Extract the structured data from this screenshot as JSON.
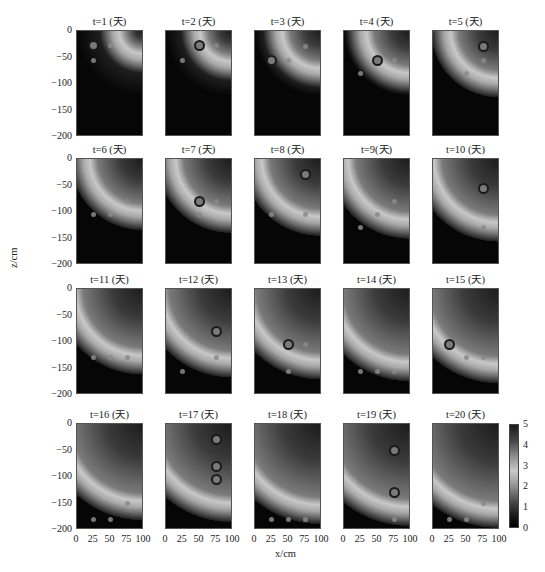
{
  "chart_data": {
    "type": "heatmap",
    "title": "",
    "xlabel": "x/cm",
    "ylabel": "z/cm",
    "xlim": [
      0,
      100
    ],
    "ylim": [
      -200,
      0
    ],
    "x_ticks": [
      "0",
      "25",
      "50",
      "75",
      "100"
    ],
    "y_ticks": [
      "0",
      "-50",
      "-100",
      "-150",
      "-200"
    ],
    "colorbar": {
      "ticks": [
        "5",
        "4",
        "3",
        "2",
        "1",
        "0"
      ],
      "range": [
        0,
        5
      ]
    },
    "grid": false,
    "layout": {
      "rows": 4,
      "cols": 5
    },
    "panels": [
      {
        "title": "t=1 (天)",
        "front_radius": 0.3,
        "dots": [
          [
            25,
            -28
          ],
          [
            50,
            -28
          ],
          [
            25,
            -55
          ]
        ],
        "rings": [
          [
            25,
            -28
          ]
        ]
      },
      {
        "title": "t=2 (天)",
        "front_radius": 0.38,
        "dots": [
          [
            50,
            -28
          ],
          [
            75,
            -28
          ],
          [
            25,
            -55
          ]
        ],
        "rings": [
          [
            50,
            -28
          ]
        ]
      },
      {
        "title": "t=3 (天)",
        "front_radius": 0.45,
        "dots": [
          [
            75,
            -30
          ],
          [
            50,
            -55
          ],
          [
            25,
            -55
          ]
        ],
        "rings": [
          [
            25,
            -55
          ]
        ]
      },
      {
        "title": "t=4 (天)",
        "front_radius": 0.5,
        "dots": [
          [
            50,
            -55
          ],
          [
            75,
            -55
          ],
          [
            25,
            -80
          ]
        ],
        "rings": [
          [
            50,
            -55
          ]
        ]
      },
      {
        "title": "t=5 (天)",
        "front_radius": 0.55,
        "dots": [
          [
            75,
            -30
          ],
          [
            75,
            -55
          ],
          [
            50,
            -80
          ]
        ],
        "rings": [
          [
            75,
            -30
          ]
        ]
      },
      {
        "title": "t=6 (天)",
        "front_radius": 0.6,
        "dots": [
          [
            75,
            -80
          ],
          [
            25,
            -105
          ],
          [
            50,
            -105
          ]
        ],
        "rings": []
      },
      {
        "title": "t=7 (天)",
        "front_radius": 0.63,
        "dots": [
          [
            50,
            -80
          ],
          [
            75,
            -80
          ],
          [
            50,
            -105
          ]
        ],
        "rings": [
          [
            50,
            -80
          ]
        ]
      },
      {
        "title": "t=8 (天)",
        "front_radius": 0.66,
        "dots": [
          [
            75,
            -30
          ],
          [
            25,
            -105
          ],
          [
            75,
            -105
          ]
        ],
        "rings": [
          [
            75,
            -30
          ]
        ]
      },
      {
        "title": "t=9(天)",
        "front_radius": 0.69,
        "dots": [
          [
            75,
            -80
          ],
          [
            50,
            -105
          ],
          [
            25,
            -130
          ]
        ],
        "rings": []
      },
      {
        "title": "t=10 (天)",
        "front_radius": 0.72,
        "dots": [
          [
            75,
            -55
          ],
          [
            75,
            -130
          ]
        ],
        "rings": [
          [
            75,
            -55
          ]
        ]
      },
      {
        "title": "t=11 (天)",
        "front_radius": 0.75,
        "dots": [
          [
            25,
            -130
          ],
          [
            50,
            -130
          ],
          [
            75,
            -130
          ]
        ],
        "rings": []
      },
      {
        "title": "t=12 (天)",
        "front_radius": 0.78,
        "dots": [
          [
            75,
            -80
          ],
          [
            75,
            -130
          ],
          [
            25,
            -155
          ]
        ],
        "rings": [
          [
            75,
            -80
          ]
        ]
      },
      {
        "title": "t=13 (天)",
        "front_radius": 0.8,
        "dots": [
          [
            50,
            -105
          ],
          [
            75,
            -105
          ],
          [
            50,
            -155
          ]
        ],
        "rings": [
          [
            50,
            -105
          ]
        ]
      },
      {
        "title": "t=14 (天)",
        "front_radius": 0.82,
        "dots": [
          [
            25,
            -155
          ],
          [
            50,
            -155
          ],
          [
            75,
            -155
          ]
        ],
        "rings": []
      },
      {
        "title": "t=15 (天)",
        "front_radius": 0.84,
        "dots": [
          [
            25,
            -105
          ],
          [
            50,
            -130
          ],
          [
            75,
            -130
          ]
        ],
        "rings": [
          [
            25,
            -105
          ]
        ]
      },
      {
        "title": "t=16 (天)",
        "front_radius": 0.86,
        "dots": [
          [
            75,
            -150
          ],
          [
            25,
            -180
          ],
          [
            50,
            -180
          ]
        ],
        "rings": []
      },
      {
        "title": "t=17 (天)",
        "front_radius": 0.88,
        "dots": [
          [
            75,
            -30
          ],
          [
            75,
            -80
          ],
          [
            75,
            -105
          ]
        ],
        "rings": [
          [
            75,
            -30
          ],
          [
            75,
            -80
          ],
          [
            75,
            -105
          ]
        ]
      },
      {
        "title": "t=18 (天)",
        "front_radius": 0.9,
        "dots": [
          [
            25,
            -180
          ],
          [
            50,
            -180
          ],
          [
            75,
            -180
          ]
        ],
        "rings": []
      },
      {
        "title": "t=19 (天)",
        "front_radius": 0.92,
        "dots": [
          [
            75,
            -50
          ],
          [
            75,
            -130
          ],
          [
            75,
            -180
          ]
        ],
        "rings": [
          [
            75,
            -50
          ],
          [
            75,
            -130
          ]
        ]
      },
      {
        "title": "t=20 (天)",
        "front_radius": 0.94,
        "dots": [
          [
            75,
            -150
          ],
          [
            25,
            -180
          ],
          [
            50,
            -180
          ]
        ],
        "rings": []
      }
    ]
  },
  "labels": {
    "xlabel": "x/cm",
    "ylabel": "z/cm"
  }
}
